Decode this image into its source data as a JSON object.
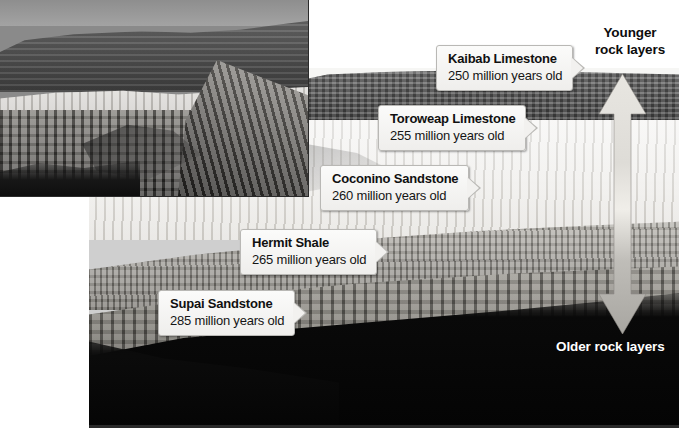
{
  "figure": {
    "type": "annotated-photo-diagram"
  },
  "photos": [
    {
      "name": "inset-canyon-photo",
      "description": "Grayscale photograph of a canyon mesa and cliff face",
      "position": "top-left"
    },
    {
      "name": "main-canyon-photo",
      "description": "Grayscale photograph of Grand Canyon wall showing horizontal rock strata",
      "position": "center-right"
    }
  ],
  "callouts": [
    {
      "id": "kaibab",
      "name": "Kaibab Limestone",
      "age_text": "250 million years old",
      "age_value": 250,
      "age_unit": "million years"
    },
    {
      "id": "toroweap",
      "name": "Toroweap Limestone",
      "age_text": "255 million years old",
      "age_value": 255,
      "age_unit": "million years"
    },
    {
      "id": "coconino",
      "name": "Coconino Sandstone",
      "age_text": "260 million years old",
      "age_value": 260,
      "age_unit": "million years"
    },
    {
      "id": "hermit",
      "name": "Hermit Shale",
      "age_text": "265 million years old",
      "age_value": 265,
      "age_unit": "million years"
    },
    {
      "id": "supai",
      "name": "Supai Sandstone",
      "age_text": "285 million years old",
      "age_value": 285,
      "age_unit": "million years"
    }
  ],
  "annotations": {
    "younger": "Younger\nrock layers",
    "younger_line1": "Younger",
    "younger_line2": "rock layers",
    "older": "Older rock layers"
  },
  "arrow": {
    "name": "double-headed-vertical-arrow",
    "direction": "up-down",
    "color": "#d9d7d2"
  },
  "colors": {
    "callout_background": "#f2f1ef",
    "callout_border": "#b9b8b5",
    "text_dark": "#101010",
    "text_light": "#ffffff",
    "arrow_fill": "#d9d7d2"
  }
}
